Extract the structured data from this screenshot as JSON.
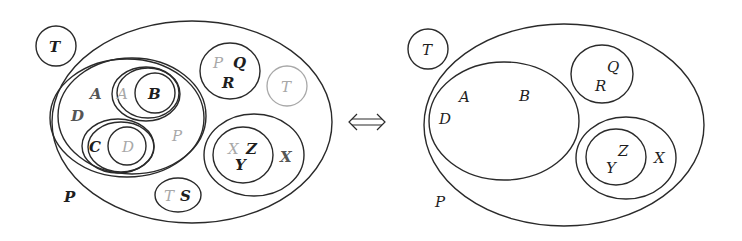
{
  "diagram": {
    "type": "nested-set venn diagrams (before ⇔ after)",
    "connector": "⟺",
    "left": {
      "outer_label": "P",
      "outside_label": "T",
      "big_set": {
        "labels": [
          "A",
          "D"
        ],
        "faint_label": "P"
      },
      "set_AB": {
        "faint_label": "A",
        "inner_label": "B"
      },
      "set_CD": {
        "label": "C",
        "faint_inner_label": "D"
      },
      "set_QR": {
        "faint_label": "P",
        "labels": [
          "Q",
          "R"
        ]
      },
      "faint_circle_label": "T",
      "set_S": {
        "faint_label": "T",
        "label": "S"
      },
      "set_X": {
        "label": "X",
        "inner": {
          "faint_label": "X",
          "labels": [
            "Z",
            "Y"
          ]
        }
      }
    },
    "right": {
      "outer_label": "P",
      "outside_label": "T",
      "big_set": {
        "labels": [
          "A",
          "B",
          "D"
        ]
      },
      "set_QR": {
        "labels": [
          "Q",
          "R"
        ]
      },
      "set_X": {
        "label": "X",
        "inner": {
          "labels": [
            "Z",
            "Y"
          ]
        }
      }
    }
  }
}
